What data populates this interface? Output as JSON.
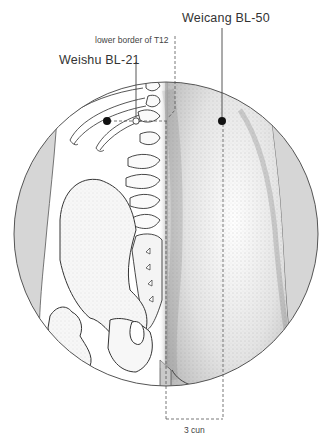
{
  "figure": {
    "type": "anatomical-acupuncture-diagram",
    "view": "lower back, posterior, body rotated (spine and pelvis skeleton on left, muscular back on right)"
  },
  "labels": {
    "weicang": "Weicang BL-50",
    "weishu": "Weishu BL-21",
    "t12": "lower border of T12",
    "measure": "3 cun"
  },
  "points": [
    {
      "name": "Weishu BL-21",
      "x": 107,
      "y": 121,
      "style": "filled"
    },
    {
      "name": "Weicang BL-50",
      "x": 222,
      "y": 121,
      "style": "filled"
    },
    {
      "name": "T12 spinous process marker",
      "x": 136,
      "y": 121,
      "style": "hollow"
    }
  ],
  "colors": {
    "line": "#444444",
    "gray_side": "#d6d6d6",
    "stipple": "#888888",
    "dot": "#111111"
  }
}
